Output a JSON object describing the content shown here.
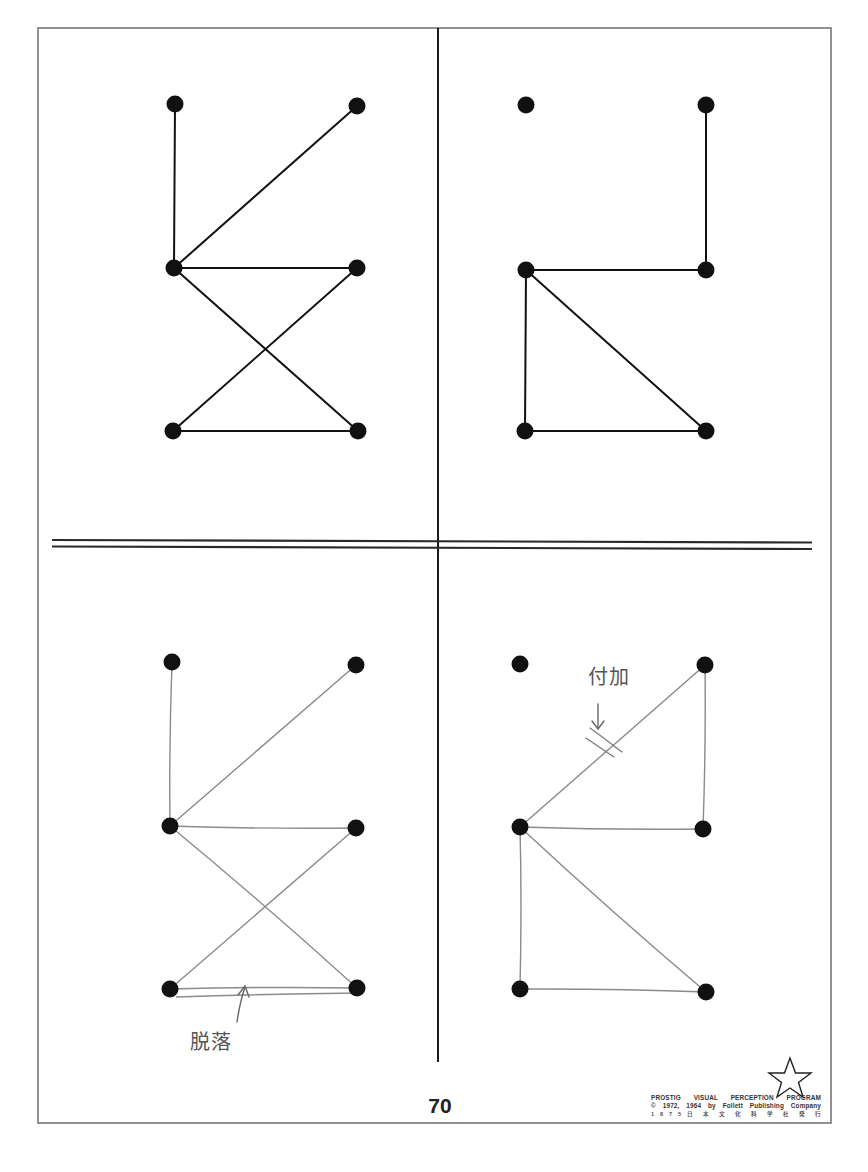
{
  "page": {
    "page_number": "70",
    "publisher_credit": {
      "line1": "PROSTIG VISUAL PERCEPTION PROGRAM",
      "line2": "© 1972, 1964 by Follett Publishing Company",
      "line3": "1 8 7 5   日 本 文 化 科 学 社 発 行"
    },
    "logo_icon": "star-outline-icon"
  },
  "layout": {
    "frame": {
      "x": 38,
      "y": 28,
      "width": 793,
      "height": 1095
    },
    "vertical_divider": {
      "x": 438,
      "y1": 28,
      "y2": 1062
    },
    "horizontal_divider": {
      "x1": 52,
      "x2": 812,
      "y_top": 541,
      "y_bottom": 548,
      "tilt": 1.5
    }
  },
  "colors": {
    "ink": "#111111",
    "frame": "#777777",
    "pencil": "#8a8a8a",
    "pencil_annotation": "#555555"
  },
  "panels": [
    {
      "id": "model-left",
      "kind": "printed-model",
      "dots": [
        [
          175,
          104
        ],
        [
          357,
          106
        ],
        [
          174,
          268
        ],
        [
          357,
          268
        ],
        [
          173,
          431
        ],
        [
          358,
          431
        ]
      ],
      "lines": [
        [
          0,
          2
        ],
        [
          2,
          1
        ],
        [
          2,
          3
        ],
        [
          2,
          5
        ],
        [
          3,
          4
        ],
        [
          4,
          5
        ]
      ]
    },
    {
      "id": "model-right",
      "kind": "printed-model",
      "dots": [
        [
          526,
          105
        ],
        [
          706,
          105
        ],
        [
          526,
          270
        ],
        [
          706,
          270
        ],
        [
          525,
          431
        ],
        [
          706,
          431
        ]
      ],
      "lines": [
        [
          1,
          3
        ],
        [
          2,
          3
        ],
        [
          2,
          4
        ],
        [
          2,
          5
        ],
        [
          4,
          5
        ]
      ]
    },
    {
      "id": "copy-left",
      "kind": "child-pencil-copy",
      "dots": [
        [
          172,
          662
        ],
        [
          356,
          665
        ],
        [
          170,
          826
        ],
        [
          356,
          828
        ],
        [
          170,
          989
        ],
        [
          357,
          988
        ]
      ],
      "lines": [
        [
          0,
          2
        ],
        [
          2,
          1
        ],
        [
          2,
          3
        ],
        [
          2,
          5
        ],
        [
          3,
          4
        ],
        [
          4,
          5
        ]
      ],
      "annotation": {
        "text": "脱落",
        "meaning": "omission",
        "x": 192,
        "y": 1030,
        "arrow_from": [
          237,
          1022
        ],
        "arrow_to": [
          245,
          987
        ]
      }
    },
    {
      "id": "copy-right",
      "kind": "child-pencil-copy",
      "dots": [
        [
          520,
          664
        ],
        [
          705,
          665
        ],
        [
          520,
          827
        ],
        [
          703,
          829
        ],
        [
          520,
          989
        ],
        [
          706,
          992
        ]
      ],
      "lines": [
        [
          1,
          2
        ],
        [
          1,
          3
        ],
        [
          2,
          3
        ],
        [
          2,
          4
        ],
        [
          2,
          5
        ],
        [
          4,
          5
        ]
      ],
      "annotation": {
        "text": "付加",
        "meaning": "addition",
        "x": 590,
        "y": 663,
        "arrow_from": [
          598,
          703
        ],
        "arrow_to": [
          598,
          730
        ]
      }
    }
  ]
}
